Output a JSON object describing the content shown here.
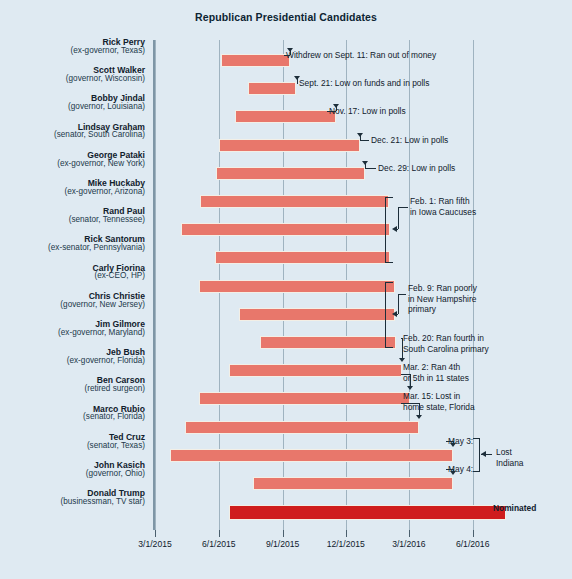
{
  "chart_data": {
    "type": "bar",
    "subtype": "gantt-timeline",
    "title": "Republican Presidential Candidates",
    "xlabel": "",
    "ylabel": "",
    "grid": true,
    "legend": "none",
    "x_axis": {
      "type": "date",
      "range": [
        "2015-03-01",
        "2016-08-01"
      ],
      "tick_labels": [
        "3/1/2015",
        "6/1/2015",
        "9/1/2015",
        "12/1/2015",
        "3/1/2016",
        "6/1/2016"
      ],
      "tick_dates": [
        "2015-03-01",
        "2015-06-01",
        "2015-09-01",
        "2015-12-01",
        "2016-03-01",
        "2016-06-01"
      ]
    },
    "bar_color": "#e8776b",
    "nominee_color": "#cf1d1d",
    "background_color": "#dfeaf2",
    "categories": [
      "Rick Perry",
      "Scott Walker",
      "Bobby Jindal",
      "Lindsay Graham",
      "George Pataki",
      "Mike Huckaby",
      "Rand Paul",
      "Rick Santorum",
      "Carly Fiorina",
      "Chris Christie",
      "Jim Gilmore",
      "Jeb Bush",
      "Ben Carson",
      "Marco Rubio",
      "Ted Cruz",
      "John Kasich",
      "Donald Trump"
    ],
    "candidates": [
      {
        "name": "Rick Perry",
        "desc": "(ex-governor, Texas)",
        "start": "2015-06-04",
        "end": "2015-09-11",
        "nominee": false
      },
      {
        "name": "Scott Walker",
        "desc": "(governor, Wisconsin)",
        "start": "2015-07-13",
        "end": "2015-09-21",
        "nominee": false
      },
      {
        "name": "Bobby Jindal",
        "desc": "(governor, Louisiana)",
        "start": "2015-06-24",
        "end": "2015-11-17",
        "nominee": false
      },
      {
        "name": "Lindsay Graham",
        "desc": "(senator, South Carolina)",
        "start": "2015-06-01",
        "end": "2015-12-21",
        "nominee": false
      },
      {
        "name": "George Pataki",
        "desc": "(ex-governor, New York)",
        "start": "2015-05-28",
        "end": "2015-12-29",
        "nominee": false
      },
      {
        "name": "Mike Huckaby",
        "desc": "(ex-governor, Arizona)",
        "start": "2015-05-05",
        "end": "2016-02-01",
        "nominee": false
      },
      {
        "name": "Rand Paul",
        "desc": "(senator, Tennessee)",
        "start": "2015-04-07",
        "end": "2016-02-03",
        "nominee": false
      },
      {
        "name": "Rick Santorum",
        "desc": "(ex-senator, Pennsylvania)",
        "start": "2015-05-27",
        "end": "2016-02-03",
        "nominee": false
      },
      {
        "name": "Carly Fiorina",
        "desc": "(ex-CEO, HP)",
        "start": "2015-05-04",
        "end": "2016-02-10",
        "nominee": false
      },
      {
        "name": "Chris Christie",
        "desc": "(governor, New Jersey)",
        "start": "2015-06-30",
        "end": "2016-02-10",
        "nominee": false
      },
      {
        "name": "Jim Gilmore",
        "desc": "(ex-governor, Maryland)",
        "start": "2015-07-30",
        "end": "2016-02-12",
        "nominee": false
      },
      {
        "name": "Jeb Bush",
        "desc": "(ex-governor, Florida)",
        "start": "2015-06-15",
        "end": "2016-02-20",
        "nominee": false
      },
      {
        "name": "Ben Carson",
        "desc": "(retired surgeon)",
        "start": "2015-05-04",
        "end": "2016-03-02",
        "nominee": false
      },
      {
        "name": "Marco Rubio",
        "desc": "(senator, Florida)",
        "start": "2015-04-13",
        "end": "2016-03-15",
        "nominee": false
      },
      {
        "name": "Ted Cruz",
        "desc": "(senator, Texas)",
        "start": "2015-03-23",
        "end": "2016-05-03",
        "nominee": false
      },
      {
        "name": "John Kasich",
        "desc": "(governor, Ohio)",
        "start": "2015-07-21",
        "end": "2016-05-04",
        "nominee": false
      },
      {
        "name": "Donald Trump",
        "desc": "(businessman, TV star)",
        "start": "2015-06-16",
        "end": "2016-07-19",
        "nominee": true
      }
    ],
    "annotations": [
      {
        "id": "perry",
        "text": "Withdrew on Sept. 11: Ran out of money"
      },
      {
        "id": "walker",
        "text": "Sept. 21: Low on funds and in polls"
      },
      {
        "id": "jindal",
        "text": "Nov. 17: Low in polls"
      },
      {
        "id": "graham",
        "text": "Dec. 21: Low in polls"
      },
      {
        "id": "pataki",
        "text": "Dec. 29: Low in polls"
      },
      {
        "id": "feb1",
        "line1": "Feb. 1: Ran fifth",
        "line2": "in Iowa Caucuses"
      },
      {
        "id": "feb9",
        "line1": "Feb. 9: Ran poorly",
        "line2": "in New Hampshire",
        "line3": "primary"
      },
      {
        "id": "feb20",
        "line1": "Feb. 20: Ran fourth in",
        "line2": "South Carolina primary"
      },
      {
        "id": "mar2",
        "line1": "Mar. 2: Ran 4th",
        "line2": "or 5th in 11 states"
      },
      {
        "id": "mar15",
        "line1": "Mar. 15: Lost in",
        "line2": "home state, Florida"
      },
      {
        "id": "may3",
        "text": "May 3:"
      },
      {
        "id": "may4",
        "text": "May 4:"
      },
      {
        "id": "indiana",
        "line1": "Lost",
        "line2": "Indiana"
      },
      {
        "id": "nominated",
        "text": "Nominated"
      }
    ]
  }
}
